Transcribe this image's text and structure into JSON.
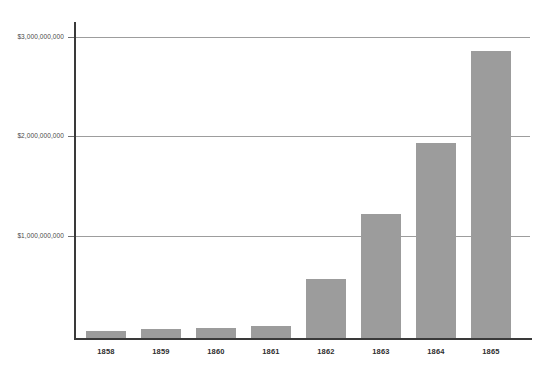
{
  "chart_data": {
    "type": "bar",
    "title": "",
    "subtitle": "",
    "xlabel": "",
    "ylabel": "",
    "categories": [
      "1858",
      "1859",
      "1860",
      "1861",
      "1862",
      "1863",
      "1864",
      "1865"
    ],
    "values": [
      70000000,
      90000000,
      100000000,
      120000000,
      590000000,
      1240000000,
      1950000000,
      2870000000
    ],
    "ylim": [
      0,
      3150000000
    ],
    "yticks": [
      1000000000,
      2000000000,
      3000000000
    ],
    "ytick_labels": [
      "$1,000,000,000",
      "$2,000,000,000",
      "$3,000,000,000"
    ],
    "grid": true,
    "grid_axis": "y",
    "legend": false,
    "legend_position": "none",
    "bar_color": "#9c9c9c",
    "gridline_color": "#9d9d9d",
    "axis_color": "#3a3a3a",
    "background_color": "#ffffff",
    "series": [
      {
        "name": "value",
        "values": [
          70000000,
          90000000,
          100000000,
          120000000,
          590000000,
          1240000000,
          1950000000,
          2870000000
        ]
      }
    ],
    "points": [
      {
        "category": "1858",
        "value": 70000000
      },
      {
        "category": "1859",
        "value": 90000000
      },
      {
        "category": "1860",
        "value": 100000000
      },
      {
        "category": "1861",
        "value": 120000000
      },
      {
        "category": "1862",
        "value": 590000000
      },
      {
        "category": "1863",
        "value": 1240000000
      },
      {
        "category": "1864",
        "value": 1950000000
      },
      {
        "category": "1865",
        "value": 2870000000
      }
    ]
  },
  "axis": {
    "y_labels": [
      {
        "text": "$3,000,000,000",
        "value": 3000000000
      },
      {
        "text": "$2,000,000,000",
        "value": 2000000000
      },
      {
        "text": "$1,000,000,000",
        "value": 1000000000
      }
    ],
    "x_labels": [
      "1858",
      "1859",
      "1860",
      "1861",
      "1862",
      "1863",
      "1864",
      "1865"
    ]
  }
}
